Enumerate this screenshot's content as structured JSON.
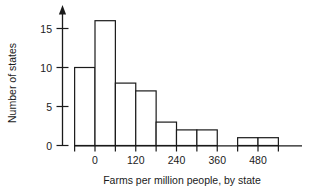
{
  "chart_data": {
    "type": "bar",
    "title": "",
    "subtitle": "",
    "xlabel": "Farms per million people, by state",
    "ylabel": "Number of states",
    "bin_width": 60,
    "bin_starts": [
      -60,
      0,
      60,
      120,
      180,
      240,
      300,
      360,
      420,
      480
    ],
    "bin_ends": [
      0,
      60,
      120,
      180,
      240,
      300,
      360,
      420,
      480,
      540
    ],
    "categories": [
      "-60 to 0",
      "0 to 60",
      "60 to 120",
      "120 to 180",
      "180 to 240",
      "240 to 300",
      "300 to 360",
      "360 to 420",
      "420 to 480",
      "480 to 540"
    ],
    "values": [
      10,
      16,
      8,
      7,
      3,
      2,
      2,
      0,
      1,
      1
    ],
    "xlim": [
      -60,
      540
    ],
    "ylim": [
      0,
      17
    ],
    "xticks": [
      0,
      120,
      240,
      360,
      480
    ],
    "xtick_labels": [
      "0",
      "120",
      "240",
      "360",
      "480"
    ],
    "yticks": [
      0,
      5,
      10,
      15
    ],
    "ytick_labels": [
      "0",
      "5",
      "10",
      "15"
    ],
    "grid": false,
    "legend": "none",
    "bar_fill_color": "#ffffff",
    "bar_stroke_color": "#1a1a1a",
    "axis_color": "#1a1a1a",
    "background_color": "#ffffff",
    "y_axis_has_arrow": true,
    "minor_xticks_every": 60
  }
}
